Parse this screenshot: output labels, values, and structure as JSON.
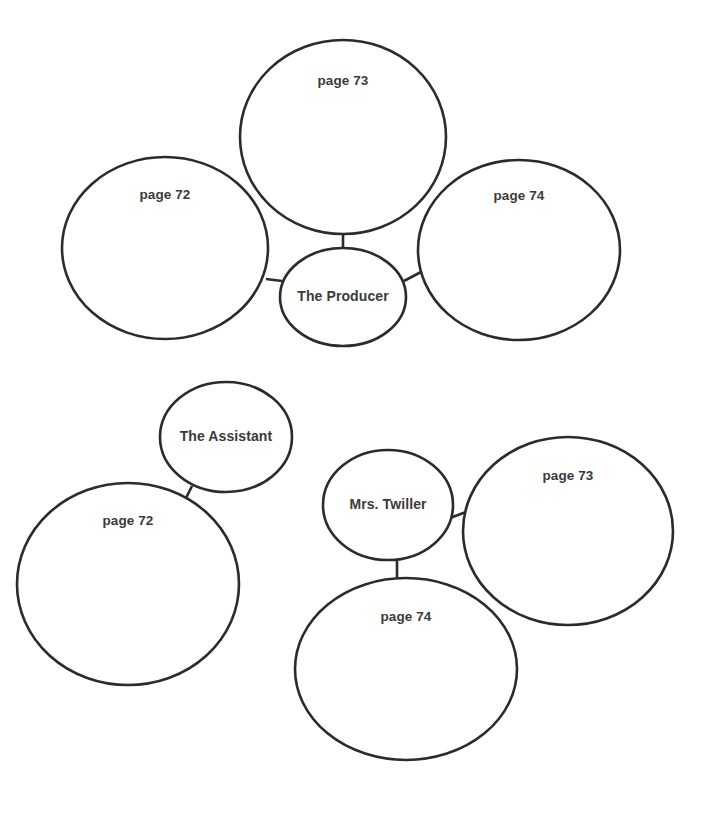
{
  "diagram": {
    "type": "bubble-concept-map",
    "title": "",
    "background_color": "#ffffff",
    "stroke_color": "#2b2b2b",
    "text_color": "#3a3a3a",
    "clusters": [
      {
        "id": "cluster-producer",
        "hub": {
          "id": "node-the-producer",
          "label": "The Producer",
          "cx": 343,
          "cy": 297,
          "rx": 63,
          "ry": 49
        },
        "satellites": [
          {
            "id": "node-producer-page-73",
            "label": "page 73",
            "cx": 343,
            "cy": 137,
            "rx": 103,
            "ry": 97,
            "label_dy": -56
          },
          {
            "id": "node-producer-page-72",
            "label": "page 72",
            "cx": 165,
            "cy": 248,
            "rx": 103,
            "ry": 91,
            "label_dy": -53
          },
          {
            "id": "node-producer-page-74",
            "label": "page 74",
            "cx": 519,
            "cy": 250,
            "rx": 101,
            "ry": 90,
            "label_dy": -54
          }
        ],
        "connectors": [
          {
            "id": "link-producer-page73",
            "x1": 343,
            "y1": 233,
            "x2": 343,
            "y2": 249
          },
          {
            "id": "link-producer-page72",
            "x1": 266,
            "y1": 279,
            "x2": 282,
            "y2": 281
          },
          {
            "id": "link-producer-page74",
            "x1": 404,
            "y1": 281,
            "x2": 421,
            "y2": 272
          }
        ]
      },
      {
        "id": "cluster-assistant",
        "hub": {
          "id": "node-the-assistant",
          "label": "The Assistant",
          "cx": 226,
          "cy": 437,
          "rx": 66,
          "ry": 55
        },
        "satellites": [
          {
            "id": "node-assistant-page-72",
            "label": "page 72",
            "cx": 128,
            "cy": 584,
            "rx": 111,
            "ry": 101,
            "label_dy": -63
          }
        ],
        "connectors": [
          {
            "id": "link-assistant-page72",
            "x1": 192,
            "y1": 486,
            "x2": 184,
            "y2": 502
          }
        ]
      },
      {
        "id": "cluster-twiller",
        "hub": {
          "id": "node-mrs-twiller",
          "label": "Mrs. Twiller",
          "cx": 388,
          "cy": 505,
          "rx": 65,
          "ry": 55
        },
        "satellites": [
          {
            "id": "node-twiller-page-73",
            "label": "page 73",
            "cx": 568,
            "cy": 531,
            "rx": 105,
            "ry": 94,
            "label_dy": -55
          },
          {
            "id": "node-twiller-page-74",
            "label": "page 74",
            "cx": 406,
            "cy": 669,
            "rx": 111,
            "ry": 91,
            "label_dy": -52
          }
        ],
        "connectors": [
          {
            "id": "link-twiller-page73",
            "x1": 450,
            "y1": 518,
            "x2": 466,
            "y2": 512
          },
          {
            "id": "link-twiller-page74",
            "x1": 397,
            "y1": 560,
            "x2": 397,
            "y2": 578
          }
        ]
      }
    ]
  }
}
